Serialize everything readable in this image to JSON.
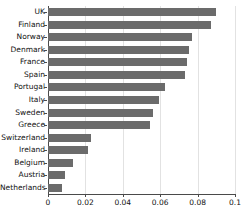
{
  "chart_data": {
    "type": "bar",
    "orientation": "horizontal",
    "title": "",
    "xlabel": "",
    "ylabel": "",
    "categories": [
      "UK",
      "Finland",
      "Norway",
      "Denmark",
      "France",
      "Spain",
      "Portugal",
      "Italy",
      "Sweden",
      "Greece",
      "Switzerland",
      "Ireland",
      "Belgium",
      "Austria",
      "Netherlands"
    ],
    "values": [
      0.09,
      0.087,
      0.077,
      0.0755,
      0.0745,
      0.0735,
      0.0625,
      0.0595,
      0.056,
      0.0545,
      0.0228,
      0.0215,
      0.0132,
      0.0092,
      0.0077
    ],
    "xlim": [
      0,
      0.1
    ],
    "xticks": [
      0,
      0.02,
      0.04,
      0.06,
      0.08,
      0.1
    ],
    "xticklabels": [
      "0",
      "0.02",
      "0.04",
      "0.06",
      "0.08",
      "0.1"
    ],
    "grid": true,
    "legend": false,
    "bar_color": "#6b6b6b",
    "axis_color": "#4a4a4a",
    "grid_color": "#e2e2e2"
  },
  "caption": ""
}
